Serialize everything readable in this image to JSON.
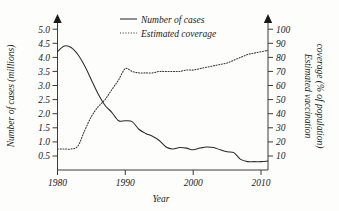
{
  "chart_data": {
    "type": "line",
    "title": "",
    "xlabel": "Year",
    "ylabel": "Number of cases (millions)",
    "y2label_line1": "Estimated vaccination",
    "y2label_line2": "coverage (% of population)",
    "xlim": [
      1980,
      2011
    ],
    "ylim": [
      0,
      5.0
    ],
    "y2lim": [
      0,
      100
    ],
    "grid": false,
    "legend_position": "top-center",
    "x_ticks": [
      "1980",
      "1990",
      "2000",
      "2010"
    ],
    "x_tick_values": [
      1980,
      1990,
      2000,
      2010
    ],
    "y_ticks": [
      "0.5",
      "1.0",
      "1.5",
      "2.0",
      "2.5",
      "3.0",
      "3.5",
      "4.0",
      "4.5",
      "5.0"
    ],
    "y_tick_values": [
      0.5,
      1.0,
      1.5,
      2.0,
      2.5,
      3.0,
      3.5,
      4.0,
      4.5,
      5.0
    ],
    "y2_ticks": [
      "10",
      "20",
      "30",
      "40",
      "50",
      "60",
      "70",
      "80",
      "90",
      "100"
    ],
    "y2_tick_values": [
      10,
      20,
      30,
      40,
      50,
      60,
      70,
      80,
      90,
      100
    ],
    "x": [
      1980,
      1981,
      1982,
      1983,
      1984,
      1985,
      1986,
      1987,
      1988,
      1989,
      1990,
      1991,
      1992,
      1993,
      1994,
      1995,
      1996,
      1997,
      1998,
      1999,
      2000,
      2001,
      2002,
      2003,
      2004,
      2005,
      2006,
      2007,
      2008,
      2009,
      2010,
      2011
    ],
    "series": [
      {
        "name": "Number of cases",
        "axis": "left",
        "style": "solid",
        "unit": "millions",
        "values": [
          4.2,
          4.4,
          4.35,
          4.1,
          3.7,
          3.2,
          2.7,
          2.3,
          2.05,
          1.75,
          1.75,
          1.72,
          1.45,
          1.3,
          1.2,
          1.05,
          0.82,
          0.75,
          0.8,
          0.78,
          0.72,
          0.78,
          0.82,
          0.8,
          0.72,
          0.65,
          0.62,
          0.38,
          0.3,
          0.3,
          0.3,
          0.32
        ]
      },
      {
        "name": "Estimated coverage",
        "axis": "right",
        "style": "dotted",
        "unit": "percent",
        "values": [
          15,
          15,
          15,
          17,
          28,
          38,
          45,
          50,
          57,
          64,
          72,
          70,
          69,
          69,
          69,
          70,
          70,
          70,
          70,
          71,
          71,
          72,
          73,
          74,
          75,
          76,
          78,
          80,
          82,
          83,
          84,
          85
        ]
      }
    ]
  },
  "legend": {
    "items": [
      {
        "label": "Number of cases",
        "style": "solid"
      },
      {
        "label": "Estimated coverage",
        "style": "dotted"
      }
    ]
  },
  "axes": {
    "x_title": "Year",
    "y_left_title": "Number of cases (millions)",
    "y_right_title_line1": "Estimated vaccination",
    "y_right_title_line2": "coverage (% of population)"
  }
}
